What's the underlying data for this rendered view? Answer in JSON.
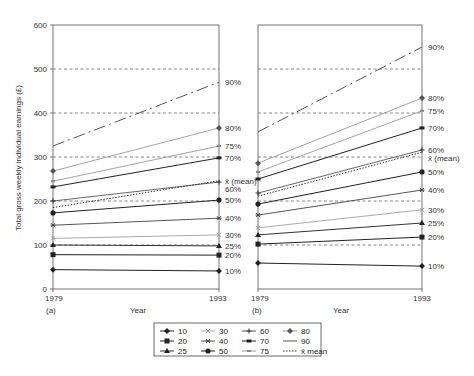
{
  "chart_data": [
    {
      "type": "line",
      "panel": "(a)",
      "x": [
        "1979",
        "1993"
      ],
      "xlabel": "Year",
      "ylabel": "Total gross weekly individual earnings (£)",
      "ylim": [
        0,
        600
      ],
      "yticks": [
        0,
        100,
        200,
        300,
        400,
        500,
        600
      ],
      "gridlines": [
        100,
        200,
        300,
        400,
        500
      ],
      "series": [
        {
          "name": "10",
          "label": "10%",
          "values": [
            44,
            41
          ]
        },
        {
          "name": "20",
          "label": "20%",
          "values": [
            78,
            77
          ]
        },
        {
          "name": "25",
          "label": "25%",
          "values": [
            100,
            98
          ]
        },
        {
          "name": "30",
          "label": "30%",
          "values": [
            115,
            123
          ]
        },
        {
          "name": "40",
          "label": "40%",
          "values": [
            145,
            161
          ]
        },
        {
          "name": "50",
          "label": "50%",
          "values": [
            173,
            202
          ]
        },
        {
          "name": "60",
          "label": "60%",
          "values": [
            200,
            243
          ]
        },
        {
          "name": "mean",
          "label": "x̄ (mean)",
          "values": [
            185,
            246
          ]
        },
        {
          "name": "70",
          "label": "70%",
          "values": [
            232,
            298
          ]
        },
        {
          "name": "75",
          "label": "75%",
          "values": [
            245,
            325
          ]
        },
        {
          "name": "80",
          "label": "80%",
          "values": [
            268,
            366
          ]
        },
        {
          "name": "90",
          "label": "90%",
          "values": [
            325,
            470
          ]
        }
      ]
    },
    {
      "type": "line",
      "panel": "(b)",
      "x": [
        "1979",
        "1993"
      ],
      "xlabel": "Year",
      "ylim": [
        0,
        600
      ],
      "gridlines": [
        100,
        200,
        300,
        400,
        500
      ],
      "series": [
        {
          "name": "10",
          "label": "10%",
          "values": [
            59,
            52
          ]
        },
        {
          "name": "20",
          "label": "20%",
          "values": [
            102,
            118
          ]
        },
        {
          "name": "25",
          "label": "25%",
          "values": [
            123,
            150
          ]
        },
        {
          "name": "30",
          "label": "30%",
          "values": [
            139,
            180
          ]
        },
        {
          "name": "40",
          "label": "40%",
          "values": [
            168,
            225
          ]
        },
        {
          "name": "50",
          "label": "50%",
          "values": [
            193,
            266
          ]
        },
        {
          "name": "mean",
          "label": "x̄ (mean)",
          "values": [
            211,
            311
          ]
        },
        {
          "name": "60",
          "label": "60%",
          "values": [
            218,
            316
          ]
        },
        {
          "name": "70",
          "label": "70%",
          "values": [
            250,
            366
          ]
        },
        {
          "name": "75",
          "label": "75%",
          "values": [
            266,
            405
          ]
        },
        {
          "name": "80",
          "label": "80%",
          "values": [
            286,
            434
          ]
        },
        {
          "name": "90",
          "label": "90%",
          "values": [
            357,
            550
          ]
        }
      ]
    }
  ],
  "legend": [
    {
      "key": "10",
      "label": "10",
      "marker": "diamond"
    },
    {
      "key": "20",
      "label": "20",
      "marker": "square"
    },
    {
      "key": "25",
      "label": "25",
      "marker": "triangle"
    },
    {
      "key": "30",
      "label": "30",
      "marker": "x"
    },
    {
      "key": "40",
      "label": "40",
      "marker": "star"
    },
    {
      "key": "50",
      "label": "50",
      "marker": "circle"
    },
    {
      "key": "60",
      "label": "60",
      "marker": "plus"
    },
    {
      "key": "70",
      "label": "70",
      "marker": "bar"
    },
    {
      "key": "75",
      "label": "75",
      "marker": "dash"
    },
    {
      "key": "80",
      "label": "80",
      "marker": "diamond-grey"
    },
    {
      "key": "90",
      "label": "90",
      "marker": "none"
    },
    {
      "key": "mean",
      "label": "x̄ mean",
      "marker": "dotted"
    }
  ],
  "styles": {
    "10": {
      "color": "#222222",
      "width": 1.0,
      "dash": ""
    },
    "20": {
      "color": "#222222",
      "width": 1.0,
      "dash": ""
    },
    "25": {
      "color": "#333333",
      "width": 1.0,
      "dash": ""
    },
    "30": {
      "color": "#aaaaaa",
      "width": 1.0,
      "dash": ""
    },
    "40": {
      "color": "#555555",
      "width": 1.0,
      "dash": ""
    },
    "50": {
      "color": "#222222",
      "width": 1.0,
      "dash": ""
    },
    "60": {
      "color": "#555555",
      "width": 0.9,
      "dash": ""
    },
    "mean": {
      "color": "#333333",
      "width": 1.0,
      "dash": "1.5,1.5"
    },
    "70": {
      "color": "#222222",
      "width": 1.0,
      "dash": ""
    },
    "75": {
      "color": "#999999",
      "width": 0.9,
      "dash": ""
    },
    "80": {
      "color": "#999999",
      "width": 0.9,
      "dash": ""
    },
    "90": {
      "color": "#555555",
      "width": 1.0,
      "dash": "12,4,2,4"
    }
  },
  "labels": {
    "panel_a": "(a)",
    "panel_b": "(b)",
    "year_start": "1979",
    "year_end": "1993",
    "xlabel": "Year",
    "ylabel": "Total gross weekly individual earnings (£)"
  }
}
